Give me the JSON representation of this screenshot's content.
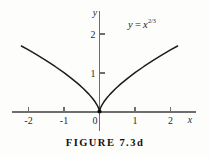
{
  "figure": {
    "caption": "FIGURE 7.3d",
    "equation": {
      "lhs": "y",
      "operator": "=",
      "base": "x",
      "exponent": "2/3",
      "full": "y = x^(2/3)"
    }
  },
  "chart_data": {
    "type": "line",
    "title": "",
    "annotation": "y = x^(2/3)",
    "function": "y = x^(2/3)",
    "xlabel": "x",
    "ylabel": "y",
    "xlim": [
      -2.45,
      2.45
    ],
    "ylim": [
      -0.35,
      2.6
    ],
    "xticks": [
      -2,
      -1,
      0,
      1,
      2
    ],
    "xtick_labels": [
      "-2",
      "-1",
      "0",
      "1",
      "2"
    ],
    "yticks": [
      1,
      2
    ],
    "ytick_labels": [
      "1",
      "2"
    ],
    "grid": false,
    "legend": "none",
    "x": [
      -2.2,
      -2.0,
      -1.75,
      -1.5,
      -1.25,
      -1.0,
      -0.8,
      -0.6,
      -0.45,
      -0.3,
      -0.2,
      -0.12,
      -0.06,
      -0.02,
      0,
      0.02,
      0.06,
      0.12,
      0.2,
      0.3,
      0.45,
      0.6,
      0.8,
      1.0,
      1.25,
      1.5,
      1.75,
      2.0,
      2.2
    ],
    "values": [
      1.688,
      1.587,
      1.451,
      1.31,
      1.16,
      1.0,
      0.862,
      0.711,
      0.588,
      0.448,
      0.342,
      0.243,
      0.153,
      0.074,
      0.0,
      0.074,
      0.153,
      0.243,
      0.342,
      0.448,
      0.588,
      0.711,
      0.862,
      1.0,
      1.16,
      1.31,
      1.451,
      1.587,
      1.688
    ]
  },
  "axes": {
    "x_axis_label": "x",
    "y_axis_label": "y"
  }
}
